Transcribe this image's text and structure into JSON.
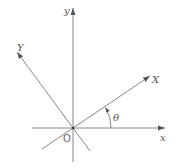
{
  "diagram": {
    "labels": {
      "x_axis": "x",
      "y_axis": "y",
      "rotated_x_axis": "X",
      "rotated_y_axis": "Y",
      "origin": "O",
      "angle": "θ"
    },
    "colors": {
      "axis": "#888888",
      "text": "#555555"
    }
  }
}
